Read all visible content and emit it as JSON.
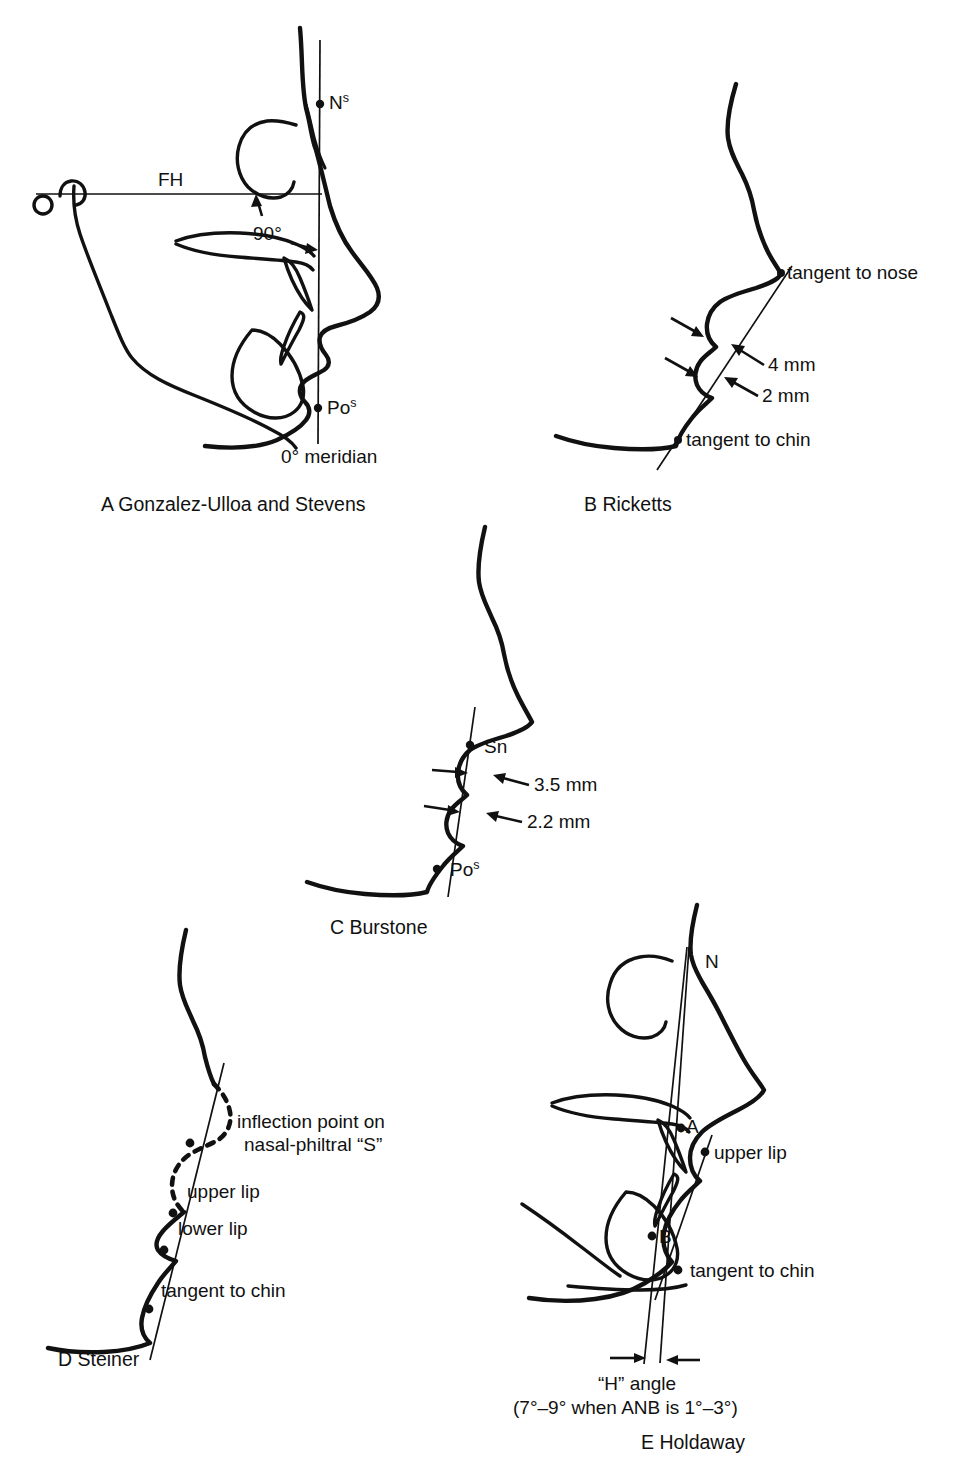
{
  "figure": {
    "background_color": "#ffffff",
    "ink_color": "#111111"
  },
  "panels": [
    {
      "id": "A",
      "letter": "A",
      "caption": "A  Gonzalez-Ulloa and Stevens",
      "name": "Gonzalez-Ulloa and Stevens",
      "labels": {
        "nasion_soft": "N",
        "nasion_soft_sup": "s",
        "fh_line": "FH",
        "angle": "90°",
        "pogonion_soft": "Po",
        "pogonion_soft_sup": "s",
        "meridian": "0° meridian"
      }
    },
    {
      "id": "B",
      "letter": "B",
      "caption": "B  Ricketts",
      "name": "Ricketts",
      "labels": {
        "tangent_nose": "tangent to nose",
        "upper_measure": "4 mm",
        "lower_measure": "2 mm",
        "tangent_chin": "tangent to chin"
      }
    },
    {
      "id": "C",
      "letter": "C",
      "caption": "C  Burstone",
      "name": "Burstone",
      "labels": {
        "subnasale": "Sn",
        "upper_measure": "3.5 mm",
        "lower_measure": "2.2 mm",
        "pogonion_soft": "Po",
        "pogonion_soft_sup": "s"
      }
    },
    {
      "id": "D",
      "letter": "D",
      "caption": "D  Steiner",
      "name": "Steiner",
      "labels": {
        "inflection_line1": "inflection point on",
        "inflection_line2": "nasal-philtral “S”",
        "upper_lip": "upper lip",
        "lower_lip": "lower lip",
        "tangent_chin": "tangent to chin"
      }
    },
    {
      "id": "E",
      "letter": "E",
      "caption": "E  Holdaway",
      "name": "Holdaway",
      "labels": {
        "nasion": "N",
        "point_a": "A",
        "point_b": "B",
        "upper_lip": "upper lip",
        "tangent_chin": "tangent to chin",
        "h_angle_line1": "“H” angle",
        "h_angle_line2": "(7°–9° when ANB is 1°–3°)"
      }
    }
  ]
}
